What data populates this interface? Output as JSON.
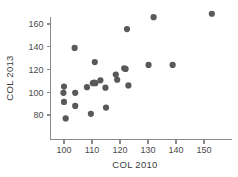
{
  "chart_data": {
    "type": "scatter",
    "title": "",
    "xlabel": "COL 2010",
    "ylabel": "COL 2013",
    "xlim": [
      96,
      158
    ],
    "ylim": [
      72,
      175
    ],
    "xticks": [
      100,
      110,
      120,
      130,
      140,
      150
    ],
    "yticks": [
      80,
      100,
      120,
      140,
      160
    ],
    "xtick_labels": [
      "100",
      "110",
      "120",
      "130",
      "140",
      "150"
    ],
    "ytick_labels": [
      "80",
      "100",
      "120",
      "140",
      "160"
    ],
    "grid": false,
    "legend": false,
    "marker": "circle",
    "marker_color": "#595959",
    "marker_size": 3.1,
    "points": [
      {
        "x": 100.0,
        "y": 105.0
      },
      {
        "x": 99.8,
        "y": 99.5
      },
      {
        "x": 100.0,
        "y": 91.5
      },
      {
        "x": 100.6,
        "y": 77.0
      },
      {
        "x": 103.8,
        "y": 139.0
      },
      {
        "x": 104.0,
        "y": 99.5
      },
      {
        "x": 104.0,
        "y": 88.0
      },
      {
        "x": 108.2,
        "y": 104.5
      },
      {
        "x": 109.6,
        "y": 81.0
      },
      {
        "x": 110.3,
        "y": 108.0
      },
      {
        "x": 110.8,
        "y": 108.5
      },
      {
        "x": 111.2,
        "y": 108.0
      },
      {
        "x": 111.0,
        "y": 126.5
      },
      {
        "x": 113.0,
        "y": 110.5
      },
      {
        "x": 114.8,
        "y": 104.0
      },
      {
        "x": 115.0,
        "y": 86.5
      },
      {
        "x": 118.5,
        "y": 115.5
      },
      {
        "x": 119.0,
        "y": 111.0
      },
      {
        "x": 121.5,
        "y": 121.0
      },
      {
        "x": 122.0,
        "y": 120.5
      },
      {
        "x": 122.5,
        "y": 155.5
      },
      {
        "x": 123.0,
        "y": 106.0
      },
      {
        "x": 130.2,
        "y": 124.0
      },
      {
        "x": 132.0,
        "y": 166.0
      },
      {
        "x": 138.8,
        "y": 124.0
      },
      {
        "x": 152.8,
        "y": 169.0
      }
    ]
  },
  "axes": {
    "x_axis_name": "COL 2010",
    "y_axis_name": "COL 2013"
  }
}
